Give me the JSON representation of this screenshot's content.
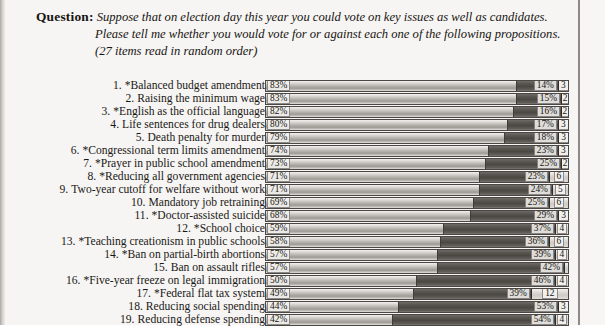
{
  "question": {
    "label": "Question:",
    "lines": [
      "Suppose that on election day this year you could vote on key issues as well as candidates.",
      "Please tell me whether you would vote for or against each one of the following propositions.",
      "(27 items read in random order)"
    ]
  },
  "chart_data": {
    "type": "bar",
    "orientation": "horizontal",
    "stacked": true,
    "title": "",
    "xlabel": "",
    "ylabel": "",
    "xlim": [
      0,
      100
    ],
    "grid": false,
    "legend": [],
    "series": [
      {
        "name": "For",
        "key": "for"
      },
      {
        "name": "Against",
        "key": "against"
      },
      {
        "name": "Don't know",
        "key": "dk"
      }
    ],
    "categories": [
      "*Balanced budget amendment",
      "Raising the minimum wage",
      "*English as the official language",
      "Life sentences for drug dealers",
      "Death penalty for murder",
      "*Congressional term limits amendment",
      "*Prayer in public school amendment",
      "*Reducing all government agencies",
      "Two-year cutoff for welfare without work",
      "Mandatory job retraining",
      "*Doctor-assisted suicide",
      "*School choice",
      "*Teaching creationism in public schools",
      "*Ban on partial-birth abortions",
      "Ban on assault rifles",
      "*Five-year freeze on legal immigration",
      "*Federal flat tax system",
      "Reducing social spending",
      "Reducing defense spending"
    ],
    "rows": [
      {
        "num": "1.",
        "label": "*Balanced budget amendment",
        "for": 83,
        "against": 14,
        "dk": 3,
        "for_label": "83%",
        "against_label": "14%",
        "dk_label": "3"
      },
      {
        "num": "2.",
        "label": "Raising the minimum wage",
        "for": 83,
        "against": 15,
        "dk": 2,
        "for_label": "83%",
        "against_label": "15%",
        "dk_label": "2"
      },
      {
        "num": "3.",
        "label": "*English as the official language",
        "for": 82,
        "against": 16,
        "dk": 2,
        "for_label": "82%",
        "against_label": "16%",
        "dk_label": "2"
      },
      {
        "num": "4.",
        "label": "Life sentences for drug dealers",
        "for": 80,
        "against": 17,
        "dk": 3,
        "for_label": "80%",
        "against_label": "17%",
        "dk_label": "3"
      },
      {
        "num": "5.",
        "label": "Death penalty for murder",
        "for": 79,
        "against": 18,
        "dk": 3,
        "for_label": "79%",
        "against_label": "18%",
        "dk_label": "3"
      },
      {
        "num": "6.",
        "label": "*Congressional term limits amendment",
        "for": 74,
        "against": 23,
        "dk": 3,
        "for_label": "74%",
        "against_label": "23%",
        "dk_label": "3"
      },
      {
        "num": "7.",
        "label": "*Prayer in public school amendment",
        "for": 73,
        "against": 25,
        "dk": 2,
        "for_label": "73%",
        "against_label": "25%",
        "dk_label": "2"
      },
      {
        "num": "8.",
        "label": "*Reducing all government agencies",
        "for": 71,
        "against": 23,
        "dk": 6,
        "for_label": "71%",
        "against_label": "23%",
        "dk_label": "6"
      },
      {
        "num": "9.",
        "label": "Two-year cutoff for welfare without work",
        "for": 71,
        "against": 24,
        "dk": 5,
        "for_label": "71%",
        "against_label": "24%",
        "dk_label": "5"
      },
      {
        "num": "10.",
        "label": "Mandatory job retraining",
        "for": 69,
        "against": 25,
        "dk": 6,
        "for_label": "69%",
        "against_label": "25%",
        "dk_label": "6"
      },
      {
        "num": "11.",
        "label": "*Doctor-assisted suicide",
        "for": 68,
        "against": 29,
        "dk": 3,
        "for_label": "68%",
        "against_label": "29%",
        "dk_label": "3"
      },
      {
        "num": "12.",
        "label": "*School choice",
        "for": 59,
        "against": 37,
        "dk": 4,
        "for_label": "59%",
        "against_label": "37%",
        "dk_label": "4"
      },
      {
        "num": "13.",
        "label": "*Teaching creationism in public schools",
        "for": 58,
        "against": 36,
        "dk": 6,
        "for_label": "58%",
        "against_label": "36%",
        "dk_label": "6"
      },
      {
        "num": "14.",
        "label": "*Ban on partial-birth abortions",
        "for": 57,
        "against": 39,
        "dk": 4,
        "for_label": "57%",
        "against_label": "39%",
        "dk_label": "4"
      },
      {
        "num": "15.",
        "label": "Ban on assault rifles",
        "for": 57,
        "against": 42,
        "dk": 1,
        "for_label": "57%",
        "against_label": "42%",
        "dk_label": "1"
      },
      {
        "num": "16.",
        "label": "*Five-year freeze on legal immigration",
        "for": 50,
        "against": 46,
        "dk": 4,
        "for_label": "50%",
        "against_label": "46%",
        "dk_label": "4"
      },
      {
        "num": "17.",
        "label": "*Federal flat tax system",
        "for": 49,
        "against": 39,
        "dk": 12,
        "for_label": "49%",
        "against_label": "39%",
        "dk_label": "12"
      },
      {
        "num": "18.",
        "label": "Reducing social spending",
        "for": 44,
        "against": 53,
        "dk": 3,
        "for_label": "44%",
        "against_label": "53%",
        "dk_label": "3"
      },
      {
        "num": "19.",
        "label": "Reducing defense spending",
        "for": 42,
        "against": 54,
        "dk": 4,
        "for_label": "42%",
        "against_label": "54%",
        "dk_label": "4"
      }
    ]
  },
  "colors": {
    "page_background": "#f6f5f3",
    "text": "#1a1816",
    "bar_for": "#b9b6b1",
    "bar_against": "#4b4844",
    "bar_dk": "#dedcd8",
    "bar_border": "#4a4744"
  }
}
